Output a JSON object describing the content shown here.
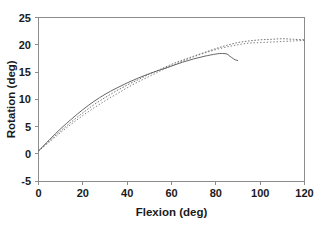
{
  "chart_data": {
    "type": "line",
    "title": "",
    "subtitle": "",
    "xlabel": "Flexion (deg)",
    "ylabel": "Rotation (deg)",
    "xlim": [
      0,
      120
    ],
    "ylim": [
      -5,
      25
    ],
    "xticks": [
      0,
      20,
      40,
      60,
      80,
      100,
      120
    ],
    "yticks": [
      -5,
      0,
      5,
      10,
      15,
      20,
      25
    ],
    "xtick_labels": [
      "0",
      "20",
      "40",
      "60",
      "80",
      "100",
      "120"
    ],
    "ytick_labels": [
      "-5",
      "0",
      "5",
      "10",
      "15",
      "20",
      "25"
    ],
    "grid": false,
    "legend": "none",
    "frame": "box",
    "series": [
      {
        "name": "solid-curve",
        "style": "solid",
        "color": "#555555",
        "x": [
          0,
          5,
          10,
          15,
          20,
          25,
          30,
          35,
          40,
          45,
          50,
          55,
          60,
          65,
          70,
          75,
          80,
          83,
          85,
          86,
          87,
          88,
          89,
          90
        ],
        "y": [
          0.5,
          2.6,
          4.6,
          6.4,
          8.1,
          9.6,
          10.9,
          12.0,
          13.0,
          13.9,
          14.7,
          15.4,
          16.1,
          16.8,
          17.4,
          17.9,
          18.3,
          18.4,
          18.3,
          18.0,
          17.7,
          17.4,
          17.2,
          17.1
        ]
      },
      {
        "name": "dotted-curve-upper",
        "style": "dotted",
        "color": "#666666",
        "x": [
          0,
          5,
          10,
          15,
          20,
          25,
          30,
          35,
          40,
          45,
          50,
          55,
          60,
          65,
          70,
          75,
          80,
          85,
          90,
          95,
          100,
          105,
          110,
          115,
          120
        ],
        "y": [
          0.5,
          2.4,
          4.2,
          5.9,
          7.5,
          9.0,
          10.3,
          11.5,
          12.6,
          13.6,
          14.6,
          15.5,
          16.4,
          17.2,
          17.9,
          18.6,
          19.3,
          19.9,
          20.4,
          20.7,
          20.9,
          21.0,
          21.1,
          21.0,
          20.9
        ]
      },
      {
        "name": "dotted-curve-lower",
        "style": "dotted",
        "color": "#6e6e6e",
        "x": [
          0,
          5,
          10,
          15,
          20,
          25,
          30,
          35,
          40,
          45,
          50,
          55,
          60,
          65,
          70,
          75,
          80,
          85,
          90,
          95,
          100,
          105,
          110,
          115,
          120
        ],
        "y": [
          0.5,
          2.2,
          3.9,
          5.5,
          7.0,
          8.4,
          9.7,
          10.9,
          12.1,
          13.2,
          14.2,
          15.2,
          16.1,
          17.0,
          17.8,
          18.5,
          19.1,
          19.6,
          20.0,
          20.3,
          20.4,
          20.5,
          20.6,
          20.7,
          20.8
        ]
      }
    ]
  },
  "colors": {
    "background": "#ffffff",
    "frame": "#8c8c8c",
    "text": "#1a1a1a",
    "solid_series": "#555555",
    "dotted_series": "#666666"
  }
}
